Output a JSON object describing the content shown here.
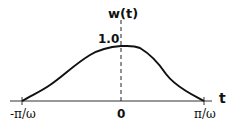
{
  "diagram": {
    "y_axis_label": "w(t)",
    "x_axis_label": "t",
    "peak_label": "1.0",
    "x_ticks": [
      {
        "label": "-π/ω",
        "position": "left"
      },
      {
        "label": "0",
        "position": "center"
      },
      {
        "label": "π/ω",
        "position": "right"
      }
    ],
    "curve": "smooth bell-shaped window from -π/ω to π/ω with peak value 1.0 at t=0",
    "colors": {
      "line": "#111111",
      "background": "#ffffff"
    }
  }
}
